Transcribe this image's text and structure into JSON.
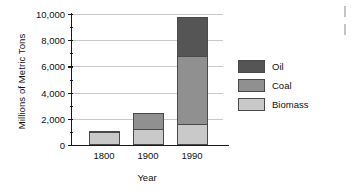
{
  "chart_data": {
    "type": "bar",
    "subtype": "stacked-bar",
    "title": "",
    "xlabel": "Year",
    "ylabel": "Millions of Metric Tons",
    "categories": [
      "1800",
      "1900",
      "1990"
    ],
    "series": [
      {
        "name": "Biomass",
        "values": [
          900,
          1150,
          1500
        ],
        "color": "#c9c9c9"
      },
      {
        "name": "Coal",
        "values": [
          0,
          1250,
          5200
        ],
        "color": "#909090"
      },
      {
        "name": "Oil",
        "values": [
          100,
          0,
          3000
        ],
        "color": "#555555"
      }
    ],
    "stack_order": [
      "Biomass",
      "Coal",
      "Oil"
    ],
    "totals": [
      1000,
      2400,
      9700
    ],
    "ylim": [
      0,
      10000
    ],
    "ytick_values": [
      0,
      2000,
      4000,
      6000,
      8000,
      10000
    ],
    "ytick_labels": [
      "0",
      "2,000",
      "4,000",
      "6,000",
      "8,000",
      "10,000"
    ],
    "yminor_values": [
      1000,
      3000,
      5000,
      7000,
      9000
    ],
    "grid": "horizontal",
    "legend_position": "right",
    "legend_entries": [
      "Oil",
      "Coal",
      "Biomass"
    ]
  },
  "axes": {
    "y_title": "Millions of Metric Tons",
    "x_title": "Year"
  }
}
